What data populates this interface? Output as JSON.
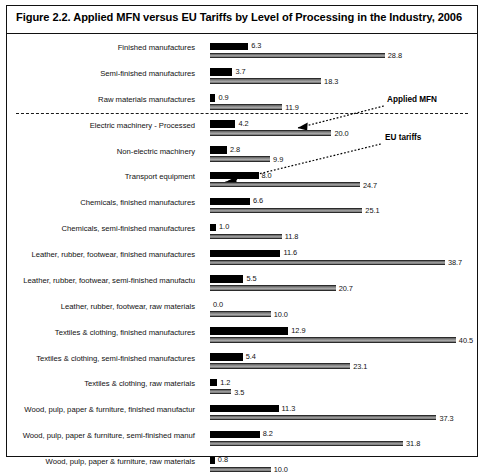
{
  "figure": {
    "title": "Figure 2.2.  Applied MFN versus EU Tariffs by Level of Processing in the Industry, 2006"
  },
  "annotations": {
    "applied_mfn": "Applied MFN",
    "eu_tariffs": "EU tariffs"
  },
  "colors": {
    "applied_mfn_bar": "#000000",
    "eu_tariffs_bar": "#8a8a8a",
    "frame": "#111111",
    "divider": "#1a1a1a"
  },
  "chart_data": {
    "type": "bar",
    "title": "Figure 2.2.  Applied MFN versus EU Tariffs by Level of Processing in the Industry, 2006",
    "orientation": "horizontal",
    "xlabel": "",
    "ylabel": "",
    "xlim": [
      0,
      41
    ],
    "grid": false,
    "legend_position": "inline-annotation",
    "categories": [
      "Finished manufactures",
      "Semi-finished manufactures",
      "Raw materials manufactures",
      "Electric machinery - Processed",
      "Non-electric machinery",
      "Transport equipment",
      "Chemicals, finished manufactures",
      "Chemicals, semi-finished manufactures",
      "Leather, rubber, footwear, finished manufactures",
      "Leather, rubber, footwear, semi-finished manufactu",
      "Leather, rubber, footwear, raw materials",
      "Textiles & clothing, finished manufactures",
      "Textiles & clothing, semi-finished manufactures",
      "Textiles & clothing, raw materials",
      "Wood, pulp, paper & furniture, finished manufactur",
      "Wood, pulp, paper & furniture, semi-finished manuf",
      "Wood, pulp, paper & furniture, raw materials"
    ],
    "series": [
      {
        "name": "Applied MFN",
        "color": "#000000",
        "values": [
          6.3,
          3.7,
          0.9,
          4.2,
          2.8,
          8.0,
          6.6,
          1.0,
          11.6,
          5.5,
          0.0,
          12.9,
          5.4,
          1.2,
          11.3,
          8.2,
          0.8
        ],
        "labels": [
          "6.3",
          "3.7",
          "0.9",
          "4.2",
          "2.8",
          "8.0",
          "6.6",
          "1.0",
          "11.6",
          "5.5",
          "0.0",
          "12.9",
          "5.4",
          "1.2",
          "11.3",
          "8.2",
          "0.8"
        ]
      },
      {
        "name": "EU tariffs",
        "color": "#8a8a8a",
        "values": [
          28.8,
          18.3,
          11.9,
          20.0,
          9.9,
          24.7,
          25.1,
          11.8,
          38.7,
          20.7,
          10.0,
          40.5,
          23.1,
          3.5,
          37.3,
          31.8,
          10.0
        ],
        "labels": [
          "28.8",
          "18.3",
          "11.9",
          "20.0",
          "9.9",
          "24.7",
          "25.1",
          "11.8",
          "38.7",
          "20.7",
          "10.0",
          "40.5",
          "23.1",
          "3.5",
          "37.3",
          "31.8",
          "10.0"
        ]
      }
    ],
    "divider_after_category_index": 2
  }
}
